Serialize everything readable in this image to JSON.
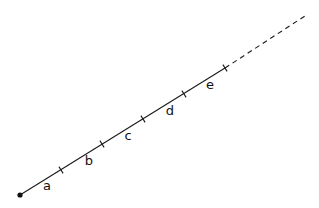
{
  "diagram": {
    "colors": {
      "stroke": "#1a1a1a",
      "text": "#111111",
      "background": "#ffffff"
    },
    "origin": {
      "x": 20,
      "y": 195
    },
    "ticks": [
      {
        "x": 61,
        "y": 170
      },
      {
        "x": 102,
        "y": 144
      },
      {
        "x": 143,
        "y": 119
      },
      {
        "x": 184,
        "y": 94
      },
      {
        "x": 225,
        "y": 68
      }
    ],
    "dashed_end": {
      "x": 308,
      "y": 14
    },
    "segments": [
      {
        "label": "a",
        "x": 47,
        "y": 190
      },
      {
        "label": "b",
        "x": 89,
        "y": 165
      },
      {
        "label": "c",
        "x": 128,
        "y": 140
      },
      {
        "label": "d",
        "x": 170,
        "y": 115
      },
      {
        "label": "e",
        "x": 210,
        "y": 89
      }
    ]
  }
}
